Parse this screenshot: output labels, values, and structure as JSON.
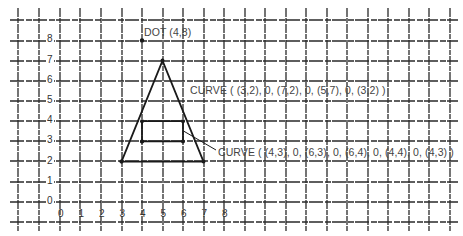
{
  "diagram": {
    "type": "coordinate-grid-drawing",
    "grid": {
      "origin_px": [
        60,
        202
      ],
      "unit_px_x": 20.5,
      "unit_px_y": 20.2,
      "vertical_lines_px": [
        18,
        39,
        60,
        80,
        101,
        122,
        142,
        163,
        183,
        204,
        224,
        245,
        265,
        286,
        306,
        327,
        347,
        368,
        388,
        409,
        429,
        450
      ],
      "horizontal_lines_px": [
        20,
        41,
        61,
        81,
        101,
        121,
        141,
        161,
        182,
        202,
        222
      ],
      "line_color": "#2a2a2a"
    },
    "y_axis_labels": [
      "8",
      "7",
      "6",
      "5",
      "4",
      "3",
      "2",
      "1",
      "0"
    ],
    "x_axis_labels": [
      "0",
      "1",
      "2",
      "3",
      "4",
      "5",
      "6",
      "7",
      "8"
    ],
    "dot": {
      "point": [
        4,
        8
      ],
      "label": "DOT  (4,8)"
    },
    "triangle": {
      "points": [
        [
          3,
          2
        ],
        [
          7,
          2
        ],
        [
          5,
          7
        ],
        [
          3,
          2
        ]
      ],
      "label": "CURVE  ( (3,2), 0, (7,2), 0, (5,7), 0, (3,2) )"
    },
    "rectangle": {
      "points": [
        [
          4,
          3
        ],
        [
          6,
          3
        ],
        [
          6,
          4
        ],
        [
          4,
          4
        ],
        [
          4,
          3
        ]
      ],
      "label": "CURVE  ( (4,3), 0, (6,3), 0, (6,4), 0, (4,4), 0, (4,3) )"
    },
    "stroke_color": "#1a1a1a"
  }
}
